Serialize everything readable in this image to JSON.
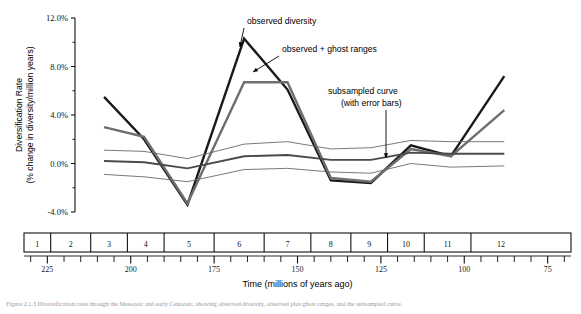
{
  "figure": {
    "caption_partial": "Figure 2.1.3 Diversification rates through the Mesozoic and early Cenozoic, showing observed diversity, observed plus ghost ranges, and the subsampled curve."
  },
  "chart_data": {
    "type": "line",
    "title": "",
    "xlabel": "Time (millions of years ago)",
    "ylabel": "Diversification Rate\n(% change in diversity/million years)",
    "ylabel_line1": "Diversification Rate",
    "ylabel_line2": "(% change in diversity/million years)",
    "ylim": [
      -4.0,
      12.0
    ],
    "ytick_labels": [
      "12.0%",
      "8.0%",
      "4.0%",
      "0.0%",
      "-4.0%"
    ],
    "ytick_values": [
      12.0,
      8.0,
      4.0,
      0.0,
      -4.0
    ],
    "yminor_values": [
      10.0,
      6.0,
      2.0,
      -2.0
    ],
    "xlim": [
      232,
      68
    ],
    "xtick_labels": [
      "225",
      "200",
      "175",
      "150",
      "125",
      "100",
      "75"
    ],
    "xtick_values": [
      225,
      200,
      175,
      150,
      125,
      100,
      75
    ],
    "xminor_step": 5,
    "grid": false,
    "legend_position": "annotations",
    "stage_boxes": [
      {
        "label": "1",
        "start": 232,
        "end": 224
      },
      {
        "label": "2",
        "start": 224,
        "end": 212
      },
      {
        "label": "3",
        "start": 212,
        "end": 201
      },
      {
        "label": "4",
        "start": 201,
        "end": 190
      },
      {
        "label": "5",
        "start": 190,
        "end": 175
      },
      {
        "label": "6",
        "start": 175,
        "end": 160
      },
      {
        "label": "7",
        "start": 160,
        "end": 146
      },
      {
        "label": "8",
        "start": 146,
        "end": 134
      },
      {
        "label": "9",
        "start": 134,
        "end": 123
      },
      {
        "label": "10",
        "start": 123,
        "end": 112
      },
      {
        "label": "11",
        "start": 112,
        "end": 98
      },
      {
        "label": "12",
        "start": 98,
        "end": 80
      }
    ],
    "x": [
      208,
      196,
      183,
      166,
      153,
      140,
      128,
      116,
      104,
      88
    ],
    "series": [
      {
        "name": "observed diversity",
        "color": "#1a1a1a",
        "width": 2.4,
        "values": [
          5.5,
          2.0,
          -3.4,
          10.3,
          6.1,
          -1.4,
          -1.6,
          1.5,
          0.6,
          7.2
        ]
      },
      {
        "name": "observed + ghost ranges",
        "color": "#6e6e6e",
        "width": 2.4,
        "values": [
          3.0,
          2.2,
          -3.3,
          6.7,
          6.7,
          -1.2,
          -1.5,
          1.2,
          0.6,
          4.4
        ]
      },
      {
        "name": "subsampled curve",
        "color": "#4a4a4a",
        "width": 1.9,
        "values": [
          0.2,
          0.1,
          -0.4,
          0.6,
          0.7,
          0.3,
          0.3,
          0.9,
          0.8,
          0.8
        ]
      },
      {
        "name": "subsampled upper error",
        "color": "#6a6a6a",
        "width": 0.9,
        "values": [
          1.1,
          1.0,
          0.4,
          1.6,
          1.8,
          1.2,
          1.3,
          1.9,
          1.8,
          1.8
        ]
      },
      {
        "name": "subsampled lower error",
        "color": "#6a6a6a",
        "width": 0.9,
        "values": [
          -0.9,
          -1.1,
          -1.5,
          -0.5,
          -0.4,
          -0.7,
          -0.8,
          0.0,
          -0.3,
          -0.2
        ]
      }
    ],
    "annotations": [
      {
        "id": "observed-diversity",
        "text": "observed diversity",
        "x": 247,
        "y": 24
      },
      {
        "id": "observed-ghost-ranges",
        "text": "observed + ghost ranges",
        "x": 282,
        "y": 52
      },
      {
        "id": "subsampled-curve-line1",
        "text": "subsampled curve",
        "x": 328,
        "y": 94
      },
      {
        "id": "subsampled-curve-line2",
        "text": "(with error bars)",
        "x": 341,
        "y": 106
      }
    ]
  }
}
